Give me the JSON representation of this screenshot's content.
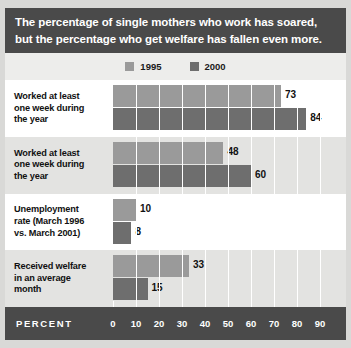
{
  "title": {
    "line1": "The percentage of single mothers who work has soared,",
    "line2": "but the percentage who get welfare has fallen even more."
  },
  "legend": {
    "items": [
      {
        "label": "1995",
        "color": "#9a9a9a"
      },
      {
        "label": "2000",
        "color": "#6e6e6e"
      }
    ]
  },
  "axis": {
    "title": "PERCENT",
    "ticks": [
      "0",
      "10",
      "20",
      "30",
      "40",
      "50",
      "60",
      "70",
      "80",
      "90"
    ]
  },
  "chart_data": {
    "type": "bar",
    "orientation": "horizontal",
    "title": "The percentage of single mothers who work has soared, but the percentage who get welfare has fallen even more.",
    "xlabel": "PERCENT",
    "ylabel": "",
    "xlim": [
      0,
      90
    ],
    "xticks": [
      0,
      10,
      20,
      30,
      40,
      50,
      60,
      70,
      80,
      90
    ],
    "grid": true,
    "legend_position": "top",
    "categories": [
      "Worked at least one week during the year",
      "Worked at least one week during the year",
      "Unemployment rate (March 1996 vs. March 2001)",
      "Received welfare in an average month"
    ],
    "series": [
      {
        "name": "1995",
        "color": "#9a9a9a",
        "values": [
          73,
          48,
          10,
          33
        ]
      },
      {
        "name": "2000",
        "color": "#6e6e6e",
        "values": [
          84,
          60,
          8,
          15
        ]
      }
    ]
  },
  "rows": [
    {
      "label_lines": [
        "Worked at least",
        "one week during",
        "the year"
      ],
      "v1995": "73",
      "v2000": "84"
    },
    {
      "label_lines": [
        "Worked at least",
        "one week during",
        "the year"
      ],
      "v1995": "48",
      "v2000": "60"
    },
    {
      "label_lines": [
        "Unemployment",
        "rate (March 1996",
        "vs. March 2001)"
      ],
      "v1995": "10",
      "v2000": "8"
    },
    {
      "label_lines": [
        "Received welfare",
        "in an average",
        "month"
      ],
      "v1995": "33",
      "v2000": "15"
    }
  ]
}
